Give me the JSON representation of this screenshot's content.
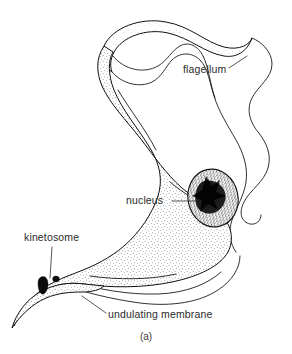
{
  "figure": {
    "caption": "(a)",
    "background_color": "#ffffff",
    "ink_color": "#111111",
    "labels": [
      {
        "id": "flagellum",
        "text": "flagellum",
        "x": 183,
        "y": 73,
        "anchor": "start",
        "leader": "M 229 68 L 247 56",
        "leader_target": "flagellum-line"
      },
      {
        "id": "nucleus",
        "text": "nucleus",
        "x": 126,
        "y": 204,
        "anchor": "start",
        "leader": "M 172 201 L 196 201",
        "leader_target": "nucleus-shape"
      },
      {
        "id": "kinetosome",
        "text": "kinetosome",
        "x": 24,
        "y": 241,
        "anchor": "start",
        "leader": "M 52 247 L 50 278",
        "leader_target": "kinetosome-blobs"
      },
      {
        "id": "undulating-membrane",
        "text": "undulating membrane",
        "x": 108,
        "y": 318,
        "anchor": "start",
        "leader": "M 106 313 L 82 296",
        "leader_target": "undulating-membrane-shape"
      }
    ],
    "structures": [
      {
        "id": "cell-body",
        "name": "cell body",
        "shading": "stipple"
      },
      {
        "id": "undulating-membrane-shape",
        "name": "undulating membrane",
        "shading": "outline"
      },
      {
        "id": "flagellum-line",
        "name": "flagellum",
        "shading": "line"
      },
      {
        "id": "nucleus-shape",
        "name": "nucleus",
        "shading": "dense-stipple"
      },
      {
        "id": "kinetosome-blobs",
        "name": "kinetosome",
        "shading": "solid-dark"
      }
    ]
  }
}
